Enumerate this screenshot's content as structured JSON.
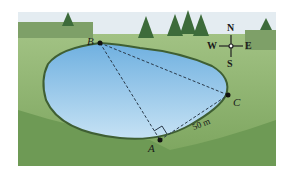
{
  "figure": {
    "points": {
      "A": "A",
      "B": "B",
      "C": "C"
    },
    "distance_label": "50 m",
    "compass": {
      "north": "N",
      "south": "S",
      "east": "E",
      "west": "W"
    },
    "colors": {
      "sky": "#e8eef3",
      "grass": "#8fb36e",
      "grass_dark": "#5e8a4a",
      "water": "#8cc3ea",
      "water_light": "#c8e3f5",
      "shore": "#3f5f33"
    }
  }
}
